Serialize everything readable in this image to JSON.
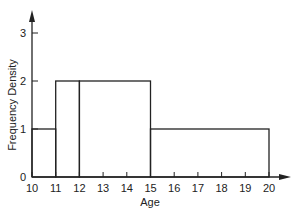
{
  "chart_data": {
    "type": "histogram",
    "title": "",
    "xlabel": "Age",
    "ylabel": "Frequency Density",
    "x_ticks": [
      10,
      11,
      12,
      13,
      14,
      15,
      16,
      17,
      18,
      19,
      20
    ],
    "y_ticks": [
      0,
      1,
      2,
      3
    ],
    "xlim": [
      10,
      20
    ],
    "ylim": [
      0,
      3.5
    ],
    "grid": false,
    "bins": [
      {
        "from": 10,
        "to": 11,
        "density": 1
      },
      {
        "from": 11,
        "to": 12,
        "density": 2
      },
      {
        "from": 12,
        "to": 15,
        "density": 2
      },
      {
        "from": 15,
        "to": 20,
        "density": 1
      }
    ]
  }
}
